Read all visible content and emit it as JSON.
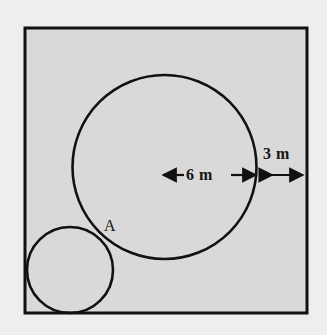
{
  "figure": {
    "background_color": "#eeeeee",
    "fill_color": "#d9d9d9",
    "stroke_color": "#111111",
    "square": {
      "name": "outer-square",
      "x": 25,
      "y": 28,
      "width": 282,
      "height": 285,
      "stroke_width": 3
    },
    "large_circle": {
      "name": "large-circle",
      "cx": 164.5,
      "cy": 167,
      "r": 92,
      "stroke_width": 2.6
    },
    "small_circle": {
      "name": "small-circle",
      "cx": 70,
      "cy": 270,
      "r": 43,
      "stroke_width": 2.6
    },
    "dimensions": [
      {
        "id": "radius-dimension",
        "label": "6 m",
        "value": 6,
        "unit": "m",
        "x1": 163,
        "x2": 256,
        "y": 175,
        "arrowheads": "both",
        "label_position": "inline"
      },
      {
        "id": "gap-dimension",
        "label": "3 m",
        "value": 3,
        "unit": "m",
        "x1": 258,
        "x2": 305,
        "y": 175,
        "arrowheads": "both",
        "label_position": "above"
      }
    ],
    "points": [
      {
        "id": "point-a",
        "label": "A",
        "x": 104,
        "y": 218,
        "description": "tangent/intersection point of the two circles"
      }
    ]
  }
}
